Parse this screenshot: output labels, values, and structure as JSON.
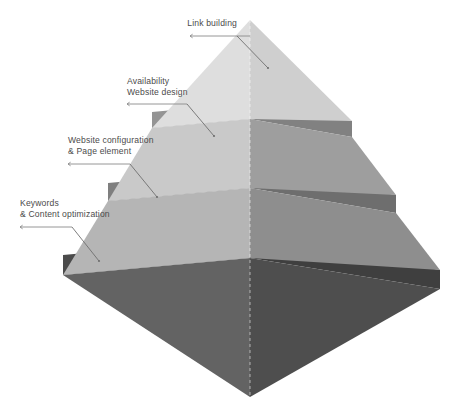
{
  "diagram": {
    "type": "layered-pyramid",
    "title": "",
    "background_color": "#ffffff",
    "text_color": "#4b4b4b",
    "leader_line_color": "#8a8a8a",
    "layers": [
      {
        "index": 1,
        "name": "link-building",
        "label_line1": "Link building",
        "label_line2": "",
        "left_face_color": "#dedede",
        "right_face_color": "#cfcfcf",
        "rim_color": "#b9b9b9"
      },
      {
        "index": 2,
        "name": "availability-website-design",
        "label_line1": "Availability",
        "label_line2": "Website design",
        "left_face_color": "#c9c9c9",
        "right_face_color": "#9d9d9d",
        "rim_color": "#8f8f8f"
      },
      {
        "index": 3,
        "name": "website-configuration-page-element",
        "label_line1": "Website configuration",
        "label_line2": "& Page element",
        "left_face_color": "#b4b4b4",
        "right_face_color": "#8d8d8d",
        "rim_color": "#7d7d7d"
      },
      {
        "index": 4,
        "name": "keywords-content-optimization",
        "label_line1": "Keywords",
        "label_line2": "& Content optimization",
        "left_face_color": "#5f5f5f",
        "right_face_color": "#4f4f4f",
        "rim_color": "#454545"
      }
    ]
  }
}
